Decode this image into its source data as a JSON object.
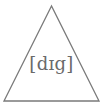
{
  "diagram": {
    "shape": "triangle",
    "label": "[dɪg]",
    "stroke_color": "#7a7a7a",
    "text_color": "#6a6a6a",
    "background": "#ffffff"
  }
}
